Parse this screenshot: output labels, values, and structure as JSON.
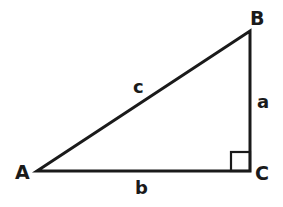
{
  "diagram": {
    "vertices": [
      {
        "name": "A",
        "x": 37,
        "y": 171
      },
      {
        "name": "B",
        "x": 250,
        "y": 31
      },
      {
        "name": "C",
        "x": 250,
        "y": 171
      }
    ],
    "vertex_labels": {
      "A": "A",
      "B": "B",
      "C": "C"
    },
    "side_labels": {
      "a": "a",
      "b": "b",
      "c": "c"
    },
    "right_angle_at": "C",
    "colors": {
      "stroke": "#1a1a1a",
      "background": "#ffffff"
    }
  }
}
